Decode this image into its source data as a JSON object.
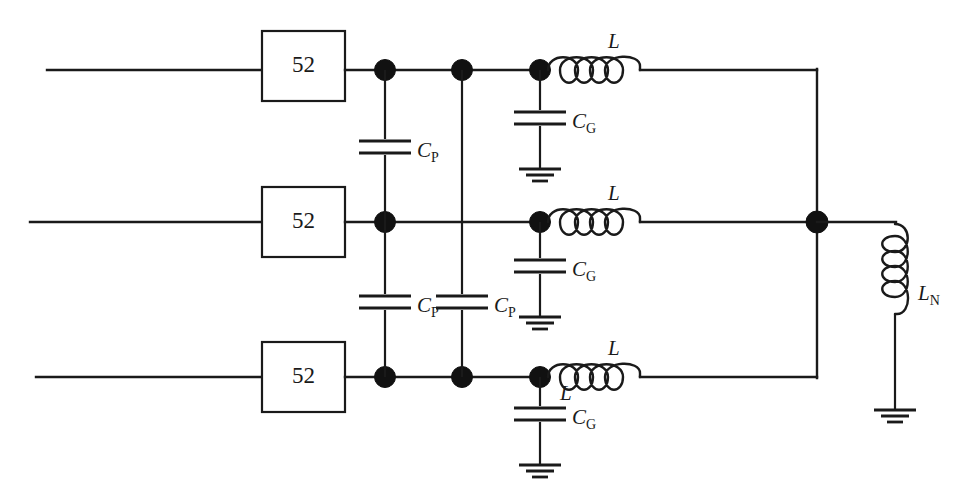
{
  "figure": {
    "background_color": "#ffffff",
    "line_color": "#1a1a1a",
    "width": 955,
    "height": 498
  },
  "breakers": {
    "label": "52",
    "count": 3,
    "items": [
      {
        "label": "52",
        "phase": "phase-a"
      },
      {
        "label": "52",
        "phase": "phase-b"
      },
      {
        "label": "52",
        "phase": "phase-c"
      }
    ]
  },
  "phase_capacitors": {
    "symbol": "C",
    "subscript": "P",
    "count": 3,
    "items": [
      {
        "symbol": "C",
        "subscript": "P",
        "between": "phase-a-phase-b"
      },
      {
        "symbol": "C",
        "subscript": "P",
        "between": "phase-b-phase-c"
      },
      {
        "symbol": "C",
        "subscript": "P",
        "between": "phase-a-phase-c"
      }
    ]
  },
  "ground_capacitors": {
    "symbol": "C",
    "subscript": "G",
    "count": 3,
    "items": [
      {
        "symbol": "C",
        "subscript": "G",
        "phase": "phase-a"
      },
      {
        "symbol": "C",
        "subscript": "G",
        "phase": "phase-b"
      },
      {
        "symbol": "C",
        "subscript": "G",
        "phase": "phase-c"
      }
    ]
  },
  "line_inductors": {
    "symbol": "L",
    "count": 3,
    "coils": 4,
    "items": [
      {
        "symbol": "L",
        "phase": "phase-a"
      },
      {
        "symbol": "L",
        "phase": "phase-b"
      },
      {
        "symbol": "L",
        "phase": "phase-c"
      },
      {
        "symbol": "L",
        "phase": "phase-c-extra"
      }
    ]
  },
  "neutral_inductor": {
    "symbol": "L",
    "subscript": "N",
    "coils": 4,
    "orientation": "vertical"
  },
  "grounds": {
    "symbol": "earth-ground",
    "count": 4
  },
  "nodes": {
    "symbol": "junction-dot",
    "count": 10
  },
  "labels": {
    "breaker": "52",
    "cap_phase": "C",
    "cap_phase_sub": "P",
    "cap_ground": "C",
    "cap_ground_sub": "G",
    "inductor": "L",
    "neutral_inductor": "L",
    "neutral_inductor_sub": "N"
  }
}
